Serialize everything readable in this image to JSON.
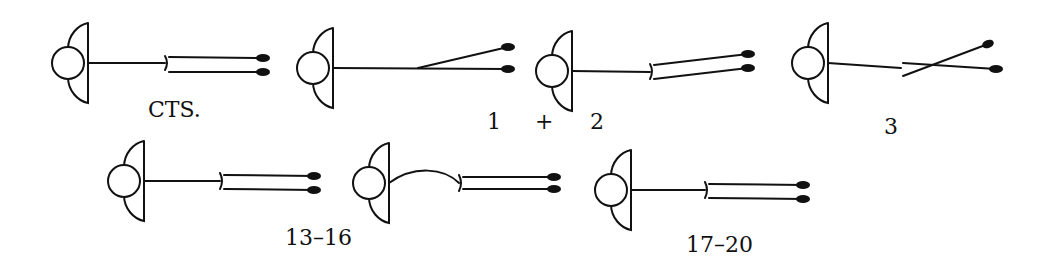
{
  "figure": {
    "stroke_color": "#111111",
    "background": "#ffffff",
    "glyphs": [
      {
        "id": "cts",
        "label": "CTS.",
        "variant": "parallel-bracket"
      },
      {
        "id": "g1",
        "label": "",
        "variant": "diverging"
      },
      {
        "id": "g2",
        "label": "",
        "variant": "angled-bracket"
      },
      {
        "id": "g3",
        "label": "",
        "variant": "crossed"
      },
      {
        "id": "g13",
        "label": "",
        "variant": "parallel-bracket"
      },
      {
        "id": "g13b",
        "label": "",
        "variant": "curved-bracket"
      },
      {
        "id": "g17",
        "label": "",
        "variant": "parallel-bracket"
      }
    ],
    "labels": {
      "cts": "CTS.",
      "one": "1",
      "plus": "+",
      "two": "2",
      "three": "3",
      "thirteen_sixteen": "13–16",
      "seventeen_twenty": "17–20"
    }
  }
}
